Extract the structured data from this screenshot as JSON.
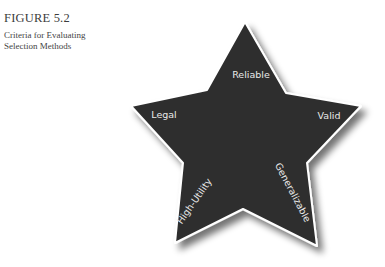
{
  "figure": {
    "number": "FIGURE 5.2",
    "title_lines": [
      "Criteria for Evaluating",
      "Selection Methods"
    ]
  },
  "star": {
    "fill_color": "#2f2f2f",
    "outline_color": "#ffffff",
    "shadow_color": "#9a9a9a",
    "labels": {
      "top": "Reliable",
      "left": "Legal",
      "right": "Valid",
      "bottom_left": "High-Utility",
      "bottom_right": "Generalizable"
    }
  }
}
